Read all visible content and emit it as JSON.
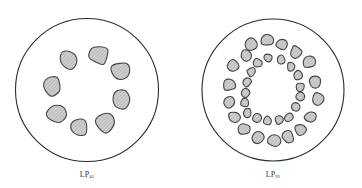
{
  "figures": [
    {
      "id": "left",
      "label_main": "LP",
      "label_sub": "41",
      "rings": [
        {
          "lobes": 8
        }
      ]
    },
    {
      "id": "right",
      "label_main": "LP",
      "label_sub": "92",
      "rings": [
        {
          "lobes": 18
        },
        {
          "lobes": 18
        }
      ]
    }
  ],
  "colors": {
    "outline": "#2a2a2a",
    "lobe_stroke": "#444444",
    "lobe_fill": "#c9c9c9",
    "hatch": "#8a8a8a"
  }
}
